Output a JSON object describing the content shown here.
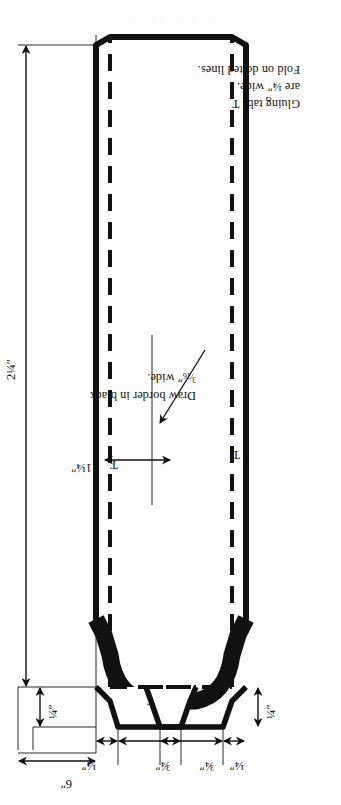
{
  "figure": {
    "caption": "DIAGRAM 2",
    "kind": "fold-and-glue cut pattern"
  },
  "dimensions": [
    {
      "id": "overall-width",
      "label": "2¼″",
      "value": 2.25,
      "unit": "in",
      "orientation": "horizontal",
      "describes": "overall width of panel from fold edge to outer edge"
    },
    {
      "id": "tab-width-top",
      "label": "¼″",
      "value": 0.25,
      "unit": "in",
      "orientation": "horizontal",
      "describes": "gluing tab width at top"
    },
    {
      "id": "tab-offset-top",
      "label": "¼″",
      "value": 0.25,
      "unit": "in",
      "orientation": "vertical",
      "describes": "distance from top edge to dotted fold line"
    },
    {
      "id": "tab-height-top",
      "label": "¾″",
      "value": 0.75,
      "unit": "in",
      "orientation": "vertical",
      "describes": "height of gluing tab T"
    },
    {
      "id": "overall-height",
      "label": "6″",
      "value": 6,
      "unit": "in",
      "orientation": "vertical",
      "describes": "overall height of the piece"
    },
    {
      "id": "waist-width",
      "label": "1¼″",
      "value": 1.25,
      "unit": "in",
      "orientation": "horizontal",
      "describes": "width at narrow waist of the curve"
    },
    {
      "id": "tab-height-bot",
      "label": "¾″",
      "value": 0.75,
      "unit": "in",
      "orientation": "vertical",
      "describes": "height of lower gluing tab T"
    },
    {
      "id": "tab-offset-bot",
      "label": "¼″",
      "value": 0.25,
      "unit": "in",
      "orientation": "vertical",
      "describes": "distance from bottom edge to dotted fold line"
    },
    {
      "id": "tab-width-bot",
      "label": "¼″",
      "value": 0.25,
      "unit": "in",
      "orientation": "horizontal",
      "describes": "gluing tab width at bottom"
    }
  ],
  "tab_markers": [
    {
      "id": "tab-t-top-strip",
      "label": "T"
    },
    {
      "id": "tab-t-top-left",
      "label": "T"
    },
    {
      "id": "tab-t-bottom-left",
      "label": "T"
    },
    {
      "id": "tab-t-bottom-strip",
      "label": "T"
    }
  ],
  "annotations": {
    "border_note": {
      "id": "border-note",
      "line1": "Draw border in black",
      "line2_prefix": "",
      "fraction_num": "3",
      "fraction_den": "16",
      "line2_suffix": "″ wide.",
      "full_text": "Draw border in black 3/16″ wide.",
      "has_leader_arrow": true
    },
    "tab_note": {
      "id": "gluing-tab-note",
      "line1": "Gluing tabs T",
      "line2": "are ¼″ wide.",
      "line3": "Fold on dotted lines.",
      "full_text": "Gluing tabs T are ¼″ wide. Fold on dotted lines."
    }
  },
  "style": {
    "ink": "#111111",
    "paper": "#fdfdfd",
    "border_fill": "#111111",
    "thin_rule": "#2b2b2b"
  }
}
